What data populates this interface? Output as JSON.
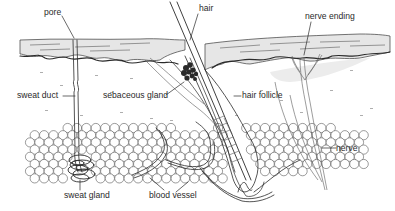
{
  "diagram": {
    "colors": {
      "ink": "#2a2a2a",
      "epidermis": "#e4e4e4",
      "dermis_shading": "#eeeeee",
      "background": "#ffffff"
    },
    "labels": {
      "pore": "pore",
      "hair": "hair",
      "nerve_ending": "nerve ending",
      "sweat_duct": "sweat duct",
      "sebaceous_gland": "sebaceous gland",
      "hair_follicle": "hair follicle",
      "nerve": "nerve",
      "sweat_gland": "sweat gland",
      "blood_vessel": "blood vessel"
    }
  }
}
